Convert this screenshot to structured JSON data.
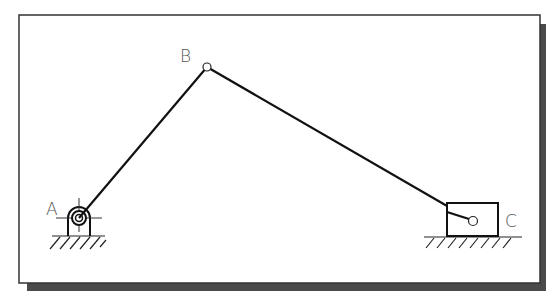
{
  "diagram": {
    "type": "slider-crank mechanism",
    "colors": {
      "frame": "#333333",
      "shadow": "#4a4a4a",
      "link": "#111111",
      "label": "#555555",
      "background": "#ffffff"
    },
    "labels": {
      "A": "A",
      "B": "B",
      "C": "C"
    },
    "points": {
      "A": [
        79,
        218
      ],
      "B": [
        207,
        67
      ],
      "C": [
        473,
        221
      ]
    },
    "links": [
      {
        "from": "A",
        "to": "B",
        "name": "crank AB"
      },
      {
        "from": "B",
        "to": "C",
        "name": "connecting rod BC"
      }
    ],
    "supports": [
      {
        "name": "fixed pivot",
        "at": "A"
      },
      {
        "name": "slider",
        "at": "C"
      }
    ]
  }
}
